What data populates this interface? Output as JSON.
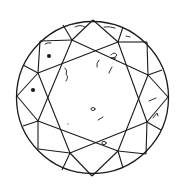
{
  "diagram": {
    "type": "diamond-clarity-plot",
    "colors": {
      "line": "#1a1a1a",
      "background": "#ffffff"
    },
    "outline": {
      "cx": 92.5,
      "cy": 97.5,
      "r": 76
    },
    "table_octagon": [
      [
        72,
        40
      ],
      [
        118,
        42
      ],
      [
        148,
        75
      ],
      [
        147,
        122
      ],
      [
        118,
        151
      ],
      [
        70,
        153
      ],
      [
        38,
        121
      ],
      [
        38,
        73
      ]
    ],
    "rim_points": [
      [
        93,
        19
      ],
      [
        123,
        27
      ],
      [
        158,
        45
      ],
      [
        167,
        97
      ],
      [
        158,
        148
      ],
      [
        123,
        168
      ],
      [
        92,
        176
      ],
      [
        62,
        170
      ],
      [
        27,
        148
      ],
      [
        17,
        95
      ],
      [
        26,
        50
      ],
      [
        63,
        25
      ]
    ],
    "inclusion_marks": [
      {
        "kind": "feather-line",
        "x": 80,
        "y": 27
      },
      {
        "kind": "feather-line",
        "x": 110,
        "y": 27
      },
      {
        "kind": "feather-line",
        "x": 128,
        "y": 36
      },
      {
        "kind": "feather-line",
        "x": 48,
        "y": 43
      },
      {
        "kind": "crystal-dot",
        "x": 49,
        "y": 55
      },
      {
        "kind": "cloud-symbol",
        "x": 114,
        "y": 57
      },
      {
        "kind": "feather-curve",
        "x": 97,
        "y": 63
      },
      {
        "kind": "feather-line",
        "x": 110,
        "y": 70
      },
      {
        "kind": "twinning-wisp",
        "x": 66,
        "y": 76
      },
      {
        "kind": "crystal-dot",
        "x": 33,
        "y": 90
      },
      {
        "kind": "pinpoint-circle",
        "x": 92,
        "y": 109
      },
      {
        "kind": "feather-line",
        "x": 100,
        "y": 118
      },
      {
        "kind": "pinpoint",
        "x": 68,
        "y": 124
      },
      {
        "kind": "feather-line",
        "x": 151,
        "y": 99
      },
      {
        "kind": "indented-natural",
        "x": 155,
        "y": 116
      },
      {
        "kind": "pinpoint-circle",
        "x": 104,
        "y": 143
      }
    ]
  }
}
